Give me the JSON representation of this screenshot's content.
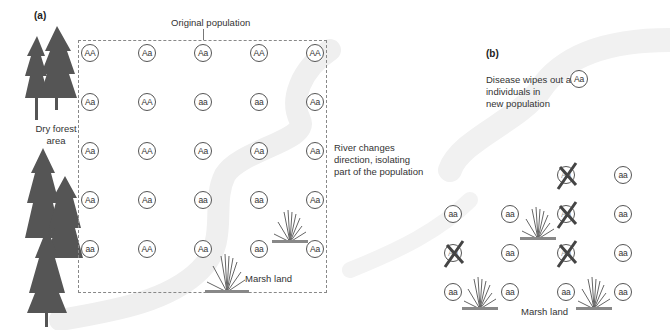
{
  "panel_a": {
    "label": "(a)",
    "title": "Original population",
    "forest_label_line1": "Dry forest",
    "forest_label_line2": "area",
    "river_label_line1": "River changes",
    "river_label_line2": "direction, isolating",
    "river_label_line3": "part of the population",
    "marsh_label": "Marsh land",
    "grid": [
      [
        "AA",
        "Aa",
        "Aa",
        "AA",
        "AA"
      ],
      [
        "Aa",
        "AA",
        "aa",
        "aa",
        "Aa"
      ],
      [
        "Aa",
        "AA",
        "Aa",
        "Aa",
        "Aa"
      ],
      [
        "Aa",
        "Aa",
        "aa",
        "aa",
        "Aa"
      ],
      [
        "aa",
        "AA",
        "Aa",
        "aa",
        "Aa"
      ]
    ]
  },
  "panel_b": {
    "label": "(b)",
    "disease_line1": "Disease wipes out all",
    "disease_line2": "individuals in",
    "disease_line3": "new population",
    "disease_genotype": "Aa",
    "marsh_label": "Marsh land",
    "individuals": [
      {
        "genotype": "Aa",
        "crossed": true
      },
      {
        "genotype": "aa",
        "crossed": false
      },
      {
        "genotype": "aa",
        "crossed": false
      },
      {
        "genotype": "aa",
        "crossed": false
      },
      {
        "genotype": "Aa",
        "crossed": true
      },
      {
        "genotype": "aa",
        "crossed": false
      },
      {
        "genotype": "Aa",
        "crossed": true
      },
      {
        "genotype": "aa",
        "crossed": false
      },
      {
        "genotype": "Aa",
        "crossed": true
      },
      {
        "genotype": "aa",
        "crossed": false
      },
      {
        "genotype": "aa",
        "crossed": false
      },
      {
        "genotype": "aa",
        "crossed": false
      },
      {
        "genotype": "aa",
        "crossed": false
      },
      {
        "genotype": "aa",
        "crossed": false
      }
    ]
  },
  "colors": {
    "river": "#efefef",
    "tree": "#555555",
    "grass": "#777777",
    "circle_border": "#555555"
  }
}
